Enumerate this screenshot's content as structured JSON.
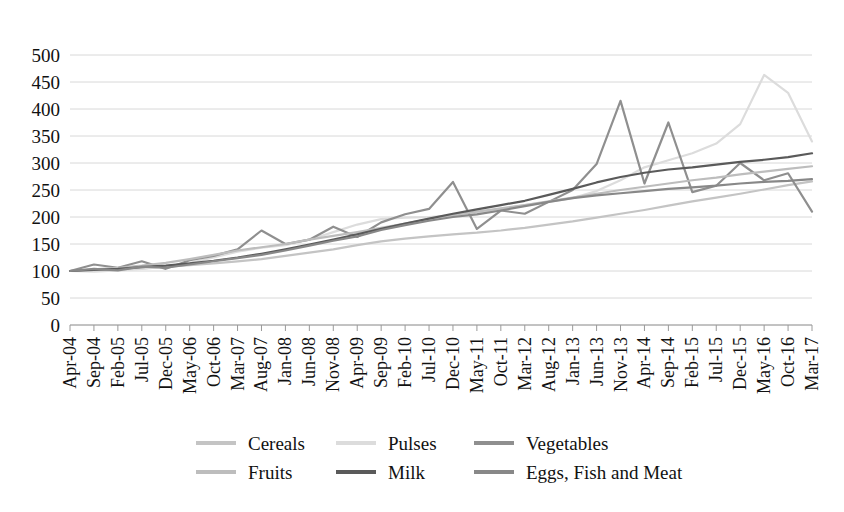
{
  "chart_data": {
    "type": "line",
    "title": "",
    "xlabel": "",
    "ylabel": "",
    "ylim": [
      0,
      500
    ],
    "ytick_step": 50,
    "grid": true,
    "legend_position": "bottom",
    "yticks": [
      "0",
      "50",
      "100",
      "150",
      "200",
      "250",
      "300",
      "350",
      "400",
      "450",
      "500"
    ],
    "categories": [
      "Apr-04",
      "Sep-04",
      "Feb-05",
      "Jul-05",
      "Dec-05",
      "May-06",
      "Oct-06",
      "Mar-07",
      "Aug-07",
      "Jan-08",
      "Jun-08",
      "Nov-08",
      "Apr-09",
      "Sep-09",
      "Feb-10",
      "Jul-10",
      "Dec-10",
      "May-11",
      "Oct-11",
      "Mar-12",
      "Aug-12",
      "Jan-13",
      "Jun-13",
      "Nov-13",
      "Apr-14",
      "Sep-14",
      "Feb-15",
      "Jul-15",
      "Dec-15",
      "May-16",
      "Oct-16",
      "Mar-17"
    ],
    "series": [
      {
        "name": "Cereals",
        "color": "#c4c4c4",
        "values": [
          100,
          101,
          103,
          105,
          108,
          111,
          114,
          118,
          122,
          128,
          134,
          140,
          148,
          155,
          160,
          164,
          168,
          171,
          175,
          180,
          186,
          192,
          199,
          206,
          213,
          221,
          229,
          236,
          243,
          251,
          259,
          266
        ]
      },
      {
        "name": "Pulses",
        "color": "#dcdcdc",
        "values": [
          100,
          99,
          101,
          104,
          108,
          115,
          125,
          136,
          143,
          148,
          158,
          172,
          186,
          196,
          199,
          200,
          203,
          208,
          215,
          222,
          228,
          235,
          248,
          268,
          292,
          305,
          318,
          336,
          372,
          463,
          430,
          340
        ]
      },
      {
        "name": "Vegetables",
        "color": "#8f8f8f",
        "values": [
          100,
          112,
          106,
          118,
          104,
          120,
          128,
          140,
          175,
          150,
          158,
          182,
          163,
          190,
          205,
          215,
          265,
          178,
          212,
          206,
          228,
          250,
          298,
          415,
          262,
          375,
          246,
          258,
          300,
          268,
          281,
          210
        ]
      },
      {
        "name": "Fruits",
        "color": "#bdbdbd",
        "values": [
          100,
          103,
          106,
          110,
          115,
          122,
          130,
          138,
          144,
          150,
          158,
          165,
          172,
          180,
          188,
          196,
          204,
          210,
          216,
          222,
          229,
          236,
          243,
          250,
          256,
          262,
          268,
          273,
          279,
          284,
          289,
          294
        ]
      },
      {
        "name": "Milk",
        "color": "#5a5a5a",
        "values": [
          100,
          102,
          104,
          107,
          110,
          114,
          119,
          125,
          132,
          140,
          149,
          158,
          168,
          178,
          188,
          197,
          206,
          214,
          222,
          230,
          241,
          252,
          264,
          274,
          282,
          288,
          292,
          297,
          302,
          306,
          311,
          318
        ]
      },
      {
        "name": "Eggs, Fish and Meat",
        "color": "#888888",
        "values": [
          100,
          104,
          101,
          108,
          106,
          112,
          118,
          124,
          130,
          138,
          147,
          156,
          164,
          176,
          185,
          193,
          200,
          205,
          212,
          220,
          228,
          235,
          240,
          244,
          248,
          252,
          255,
          258,
          262,
          265,
          267,
          270
        ]
      }
    ]
  },
  "legend": {
    "items": [
      {
        "label": "Cereals",
        "color": "#c4c4c4"
      },
      {
        "label": "Pulses",
        "color": "#dcdcdc"
      },
      {
        "label": "Vegetables",
        "color": "#8f8f8f"
      },
      {
        "label": "Fruits",
        "color": "#bdbdbd"
      },
      {
        "label": "Milk",
        "color": "#5a5a5a"
      },
      {
        "label": "Eggs, Fish and Meat",
        "color": "#888888"
      }
    ]
  }
}
